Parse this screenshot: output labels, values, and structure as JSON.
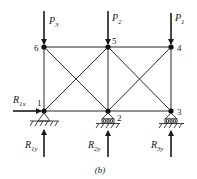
{
  "figure": {
    "caption": "(b)",
    "nodes": [
      {
        "id": "1",
        "x": 44,
        "y": 111
      },
      {
        "id": "2",
        "x": 108,
        "y": 111
      },
      {
        "id": "3",
        "x": 171,
        "y": 111
      },
      {
        "id": "4",
        "x": 171,
        "y": 47
      },
      {
        "id": "5",
        "x": 108,
        "y": 47
      },
      {
        "id": "6",
        "x": 44,
        "y": 47
      }
    ],
    "members": [
      [
        "1",
        "2"
      ],
      [
        "2",
        "3"
      ],
      [
        "6",
        "5"
      ],
      [
        "5",
        "4"
      ],
      [
        "1",
        "6"
      ],
      [
        "2",
        "5"
      ],
      [
        "3",
        "4"
      ],
      [
        "1",
        "5"
      ],
      [
        "6",
        "2"
      ],
      [
        "2",
        "4"
      ],
      [
        "5",
        "3"
      ]
    ],
    "loads": {
      "p3": {
        "main": "P",
        "sub": "3"
      },
      "p2": {
        "main": "P",
        "sub": "2"
      },
      "p1": {
        "main": "P",
        "sub": "1"
      }
    },
    "reactions": {
      "r1x": {
        "main": "R",
        "sub": "1x"
      },
      "r1y": {
        "main": "R",
        "sub": "1y"
      },
      "r2y": {
        "main": "R",
        "sub": "2y"
      },
      "r3y": {
        "main": "R",
        "sub": "3y"
      }
    },
    "node_labels": {
      "n1": "1",
      "n2": "2",
      "n3": "3",
      "n4": "4",
      "n5": "5",
      "n6": "6"
    },
    "supports": {
      "node1": "pin",
      "node2": "roller",
      "node3": "roller"
    }
  }
}
